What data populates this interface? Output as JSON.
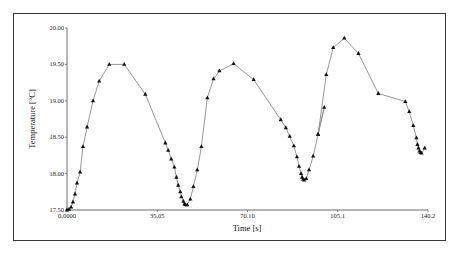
{
  "chart_data": {
    "type": "line",
    "title": "",
    "xlabel": "Time [s]",
    "ylabel": "Temperature [°C]",
    "xlim": [
      0,
      140.2
    ],
    "ylim": [
      17.5,
      20.0
    ],
    "x_ticks": [
      "0.0000",
      "35.05",
      "70.10",
      "105.1",
      "140.2"
    ],
    "x_tick_values": [
      0,
      35.05,
      70.1,
      105.1,
      140.2
    ],
    "y_ticks": [
      "17.50",
      "18.00",
      "18.50",
      "19.00",
      "19.50",
      "20.00"
    ],
    "y_tick_values": [
      17.5,
      18.0,
      18.5,
      19.0,
      19.5,
      20.0
    ],
    "grid": false,
    "legend": null,
    "marker": "triangle",
    "line_color": "#8a8a8a",
    "marker_color": "#111111",
    "series": [
      {
        "name": "Temperature",
        "x": [
          0.0,
          0.8,
          1.6,
          2.3,
          3.1,
          3.9,
          5.1,
          6.2,
          7.8,
          10.1,
          12.5,
          16.4,
          22.2,
          30.4,
          38.2,
          39.3,
          40.5,
          41.7,
          42.5,
          43.2,
          44.0,
          44.4,
          45.2,
          45.6,
          46.0,
          46.7,
          47.9,
          49.1,
          50.6,
          52.2,
          54.5,
          56.9,
          59.2,
          64.7,
          72.5,
          83.0,
          85.0,
          86.5,
          88.1,
          89.3,
          90.1,
          90.9,
          91.3,
          91.7,
          92.1,
          92.9,
          94.0,
          95.6,
          97.5,
          99.9,
          97.5,
          100.7,
          103.4,
          107.7,
          113.2,
          120.9,
          131.4,
          132.9,
          134.5,
          135.7,
          136.1,
          136.5,
          136.9,
          137.3,
          137.7,
          138.9
        ],
        "y": [
          17.5,
          17.51,
          17.54,
          17.61,
          17.72,
          17.87,
          18.02,
          18.37,
          18.64,
          19.0,
          19.27,
          19.5,
          19.5,
          19.09,
          18.42,
          18.32,
          18.2,
          18.09,
          17.95,
          17.84,
          17.75,
          17.68,
          17.62,
          17.58,
          17.57,
          17.57,
          17.65,
          17.82,
          18.05,
          18.37,
          19.04,
          19.3,
          19.41,
          19.51,
          19.29,
          18.74,
          18.63,
          18.51,
          18.38,
          18.23,
          18.1,
          18.0,
          17.95,
          17.92,
          17.91,
          17.93,
          18.05,
          18.24,
          18.54,
          18.91,
          18.54,
          19.36,
          19.73,
          19.86,
          19.65,
          19.1,
          18.99,
          18.85,
          18.66,
          18.49,
          18.4,
          18.35,
          18.31,
          18.29,
          18.28,
          18.35
        ]
      }
    ]
  }
}
